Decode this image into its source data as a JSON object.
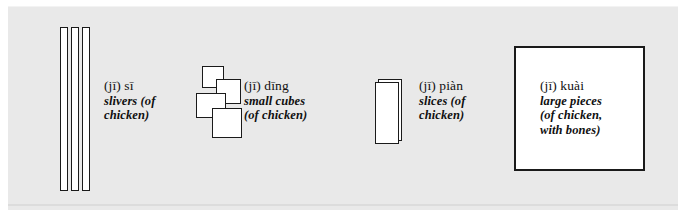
{
  "figure": {
    "background_color": "#ffffff",
    "panel_color": "#e9e9e9",
    "ink_color": "#1a1a1a"
  },
  "entries": [
    {
      "id": "slivers",
      "icon": "three-thin-strips-icon",
      "term": "(jī) sī",
      "gloss_lines": [
        "slivers (of",
        "chicken)"
      ]
    },
    {
      "id": "small-cubes",
      "icon": "four-overlapping-squares-icon",
      "term": "(jī) dīng",
      "gloss_lines": [
        "small cubes",
        "(of chicken)"
      ]
    },
    {
      "id": "slices",
      "icon": "flat-rectangle-slice-icon",
      "term": "(jī) piàn",
      "gloss_lines": [
        "slices (of",
        "chicken)"
      ]
    },
    {
      "id": "large-pieces",
      "icon": "large-square-icon",
      "term": "(jī) kuài",
      "gloss_lines": [
        "large pieces",
        "(of chicken,",
        "with bones)"
      ]
    }
  ]
}
